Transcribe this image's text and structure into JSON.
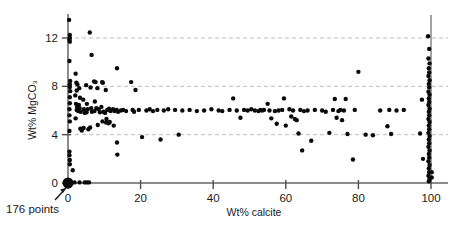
{
  "chart_data": {
    "type": "scatter",
    "title": "",
    "xlabel": "Wt% calcite",
    "ylabel": "Wt% MgCO3",
    "ylabel_display": "Wt% MgCO₃",
    "xlim": [
      0,
      104
    ],
    "ylim": [
      0,
      14
    ],
    "xticks": [
      0,
      20,
      40,
      60,
      80,
      100
    ],
    "xtick_labels": [
      "0",
      "20",
      "40",
      "60",
      "80",
      "100"
    ],
    "yticks": [
      0,
      4,
      8,
      12
    ],
    "ytick_labels": [
      "0",
      "4",
      "8",
      "12"
    ],
    "grid": {
      "horizontal": true,
      "vertical": false,
      "style": "dashed",
      "values": [
        4,
        8,
        12
      ],
      "color": "#bfbfbf"
    },
    "legend": null,
    "marker": {
      "shape": "circle",
      "color": "#0a0a0a",
      "size_px": 4.4
    },
    "annotations": [
      {
        "name": "points-count",
        "text": "176 points",
        "x_data": 0,
        "y_data": 0,
        "note": "arrow points up-right to the large bold marker at the origin"
      }
    ],
    "reference_lines": [
      {
        "name": "calcite-100-line",
        "orientation": "vertical",
        "x_data": 100,
        "y_from": 0,
        "y_to": 13.9,
        "color": "#8c8c8c"
      }
    ],
    "origin_marker": {
      "x": 0,
      "y": 0,
      "emphasized": true,
      "size_px": 11
    },
    "n_points_label": "176 points",
    "points": [
      [
        0.3,
        13.5
      ],
      [
        0.5,
        12.25
      ],
      [
        0.5,
        12.0
      ],
      [
        0.4,
        11.85
      ],
      [
        0.5,
        11.7
      ],
      [
        0.4,
        10.1
      ],
      [
        6.0,
        12.45
      ],
      [
        6.5,
        10.6
      ],
      [
        13.5,
        9.5
      ],
      [
        0.6,
        8.45
      ],
      [
        0.5,
        8.15
      ],
      [
        0.5,
        7.95
      ],
      [
        0.6,
        7.6
      ],
      [
        0.5,
        7.1
      ],
      [
        0.5,
        6.6
      ],
      [
        0.4,
        6.1
      ],
      [
        0.4,
        5.6
      ],
      [
        0.5,
        5.1
      ],
      [
        0.4,
        4.3
      ],
      [
        0.4,
        2.6
      ],
      [
        0.4,
        2.3
      ],
      [
        0.5,
        1.9
      ],
      [
        0.5,
        1.55
      ],
      [
        1.3,
        1.05
      ],
      [
        2.1,
        9.05
      ],
      [
        2.3,
        8.3
      ],
      [
        2.6,
        8.15
      ],
      [
        2.4,
        7.65
      ],
      [
        2.0,
        7.25
      ],
      [
        2.2,
        6.55
      ],
      [
        2.5,
        6.3
      ],
      [
        2.4,
        6.05
      ],
      [
        2.8,
        5.95
      ],
      [
        2.1,
        5.35
      ],
      [
        3.1,
        7.85
      ],
      [
        3.3,
        7.05
      ],
      [
        3.0,
        6.45
      ],
      [
        3.2,
        6.2
      ],
      [
        3.5,
        5.9
      ],
      [
        3.4,
        4.5
      ],
      [
        3.8,
        4.35
      ],
      [
        4.2,
        6.9
      ],
      [
        4.4,
        6.1
      ],
      [
        4.6,
        5.8
      ],
      [
        4.3,
        4.55
      ],
      [
        5.0,
        8.1
      ],
      [
        5.2,
        6.55
      ],
      [
        5.4,
        6.1
      ],
      [
        5.1,
        5.85
      ],
      [
        5.6,
        4.45
      ],
      [
        6.2,
        7.9
      ],
      [
        6.4,
        6.2
      ],
      [
        6.6,
        5.9
      ],
      [
        6.1,
        4.6
      ],
      [
        7.2,
        8.4
      ],
      [
        7.6,
        8.35
      ],
      [
        7.4,
        6.75
      ],
      [
        7.8,
        6.2
      ],
      [
        7.3,
        5.95
      ],
      [
        8.1,
        7.85
      ],
      [
        8.4,
        6.1
      ],
      [
        8.8,
        5.85
      ],
      [
        8.2,
        4.8
      ],
      [
        9.4,
        8.35
      ],
      [
        9.6,
        8.3
      ],
      [
        9.2,
        6.3
      ],
      [
        9.8,
        5.9
      ],
      [
        9.5,
        5.1
      ],
      [
        10.4,
        7.7
      ],
      [
        10.8,
        6.05
      ],
      [
        10.2,
        5.8
      ],
      [
        10.6,
        5.3
      ],
      [
        10.5,
        5.0
      ],
      [
        11.3,
        6.15
      ],
      [
        11.7,
        5.95
      ],
      [
        11.5,
        5.05
      ],
      [
        11.2,
        4.95
      ],
      [
        12.4,
        6.1
      ],
      [
        12.8,
        5.95
      ],
      [
        12.6,
        4.75
      ],
      [
        13.4,
        6.05
      ],
      [
        13.8,
        5.9
      ],
      [
        13.5,
        3.35
      ],
      [
        13.6,
        2.35
      ],
      [
        14.6,
        6.0
      ],
      [
        15.2,
        6.05
      ],
      [
        16.0,
        5.95
      ],
      [
        17.4,
        8.35
      ],
      [
        17.8,
        6.05
      ],
      [
        18.6,
        7.7
      ],
      [
        18.2,
        5.9
      ],
      [
        19.5,
        6.05
      ],
      [
        20.4,
        3.8
      ],
      [
        21.6,
        6.0
      ],
      [
        22.5,
        6.1
      ],
      [
        23.4,
        5.95
      ],
      [
        24.6,
        6.05
      ],
      [
        25.5,
        3.6
      ],
      [
        26.4,
        6.0
      ],
      [
        27.6,
        6.1
      ],
      [
        29.5,
        6.05
      ],
      [
        30.5,
        4.0
      ],
      [
        31.5,
        6.0
      ],
      [
        33.5,
        6.05
      ],
      [
        35.5,
        5.95
      ],
      [
        37.5,
        6.0
      ],
      [
        39.5,
        6.1
      ],
      [
        41.5,
        6.0
      ],
      [
        42.5,
        5.95
      ],
      [
        44.5,
        6.05
      ],
      [
        45.5,
        7.0
      ],
      [
        46.5,
        6.0
      ],
      [
        47.5,
        5.4
      ],
      [
        48.5,
        6.05
      ],
      [
        49.5,
        6.0
      ],
      [
        50.5,
        6.1
      ],
      [
        51.5,
        6.0
      ],
      [
        52.5,
        5.95
      ],
      [
        53.0,
        6.05
      ],
      [
        53.5,
        6.0
      ],
      [
        54.0,
        6.05
      ],
      [
        55.0,
        6.55
      ],
      [
        55.5,
        6.0
      ],
      [
        56.0,
        5.35
      ],
      [
        57.0,
        5.95
      ],
      [
        57.5,
        4.9
      ],
      [
        58.0,
        6.0
      ],
      [
        59.0,
        6.05
      ],
      [
        59.5,
        7.0
      ],
      [
        60.0,
        4.75
      ],
      [
        61.0,
        6.1
      ],
      [
        61.5,
        5.5
      ],
      [
        62.0,
        6.0
      ],
      [
        62.5,
        5.3
      ],
      [
        63.0,
        5.2
      ],
      [
        63.5,
        4.1
      ],
      [
        64.0,
        6.05
      ],
      [
        64.5,
        2.7
      ],
      [
        65.0,
        5.95
      ],
      [
        66.0,
        6.0
      ],
      [
        67.0,
        3.5
      ],
      [
        68.0,
        6.05
      ],
      [
        70.0,
        6.0
      ],
      [
        71.0,
        5.9
      ],
      [
        72.0,
        4.15
      ],
      [
        73.0,
        6.05
      ],
      [
        73.5,
        6.95
      ],
      [
        74.0,
        5.4
      ],
      [
        74.5,
        5.95
      ],
      [
        75.0,
        6.05
      ],
      [
        75.5,
        5.2
      ],
      [
        76.0,
        6.0
      ],
      [
        76.5,
        6.95
      ],
      [
        77.0,
        4.05
      ],
      [
        78.5,
        1.95
      ],
      [
        79.0,
        6.05
      ],
      [
        80.0,
        9.2
      ],
      [
        82.0,
        4.0
      ],
      [
        84.0,
        3.95
      ],
      [
        86.0,
        6.0
      ],
      [
        88.0,
        4.7
      ],
      [
        88.5,
        6.05
      ],
      [
        89.0,
        4.05
      ],
      [
        90.5,
        6.0
      ],
      [
        92.5,
        6.05
      ],
      [
        97.5,
        6.9
      ],
      [
        97.0,
        4.1
      ],
      [
        97.8,
        2.0
      ],
      [
        99.2,
        12.15
      ],
      [
        99.5,
        11.1
      ],
      [
        99.3,
        10.3
      ],
      [
        99.6,
        9.9
      ],
      [
        99.4,
        9.5
      ],
      [
        99.5,
        9.15
      ],
      [
        99.3,
        8.85
      ],
      [
        99.6,
        8.5
      ],
      [
        99.4,
        8.2
      ],
      [
        99.5,
        7.9
      ],
      [
        99.3,
        7.55
      ],
      [
        99.6,
        7.3
      ],
      [
        99.4,
        7.0
      ],
      [
        99.5,
        6.7
      ],
      [
        99.3,
        6.45
      ],
      [
        99.6,
        6.15
      ],
      [
        99.4,
        5.9
      ],
      [
        99.5,
        5.6
      ],
      [
        99.3,
        5.3
      ],
      [
        99.6,
        5.05
      ],
      [
        99.4,
        4.75
      ],
      [
        99.5,
        4.45
      ],
      [
        99.3,
        4.15
      ],
      [
        99.6,
        3.9
      ],
      [
        99.4,
        3.6
      ],
      [
        99.5,
        3.3
      ],
      [
        99.3,
        3.0
      ],
      [
        99.6,
        2.7
      ],
      [
        99.4,
        2.4
      ],
      [
        99.5,
        2.1
      ],
      [
        99.3,
        1.8
      ],
      [
        99.6,
        1.5
      ],
      [
        99.4,
        1.2
      ],
      [
        99.5,
        0.9
      ],
      [
        99.3,
        0.6
      ],
      [
        99.6,
        0.35
      ],
      [
        99.4,
        0.15
      ],
      [
        100.2,
        0.9
      ],
      [
        100.2,
        0.45
      ],
      [
        1.8,
        0.05
      ],
      [
        3.2,
        0.05
      ],
      [
        4.6,
        0.05
      ],
      [
        5.2,
        0.05
      ],
      [
        5.8,
        0.05
      ]
    ]
  }
}
